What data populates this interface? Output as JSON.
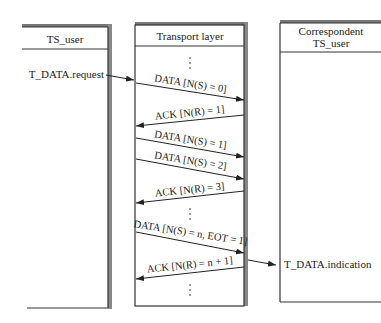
{
  "diagram": {
    "entities": {
      "ts_user": {
        "title": "TS_user"
      },
      "transport": {
        "title": "Transport layer"
      },
      "correspondent": {
        "title_line1": "Correspondent",
        "title_line2": "TS_user"
      }
    },
    "primitives": {
      "request": "T_DATA.request",
      "indication": "T_DATA.indication"
    },
    "messages": [
      {
        "label": "DATA [N(S) = 0]",
        "direction": "right"
      },
      {
        "label": "ACK [N(R) = 1]",
        "direction": "left"
      },
      {
        "label": "DATA [N(S) = 1]",
        "direction": "right"
      },
      {
        "label": "DATA [N(S) = 2]",
        "direction": "right"
      },
      {
        "label": "ACK [N(R) = 3]",
        "direction": "left"
      },
      {
        "label": "DATA [N(S) = n, EOT = 1]",
        "direction": "right"
      },
      {
        "label": "ACK [N(R) = n + 1]",
        "direction": "left"
      }
    ]
  }
}
